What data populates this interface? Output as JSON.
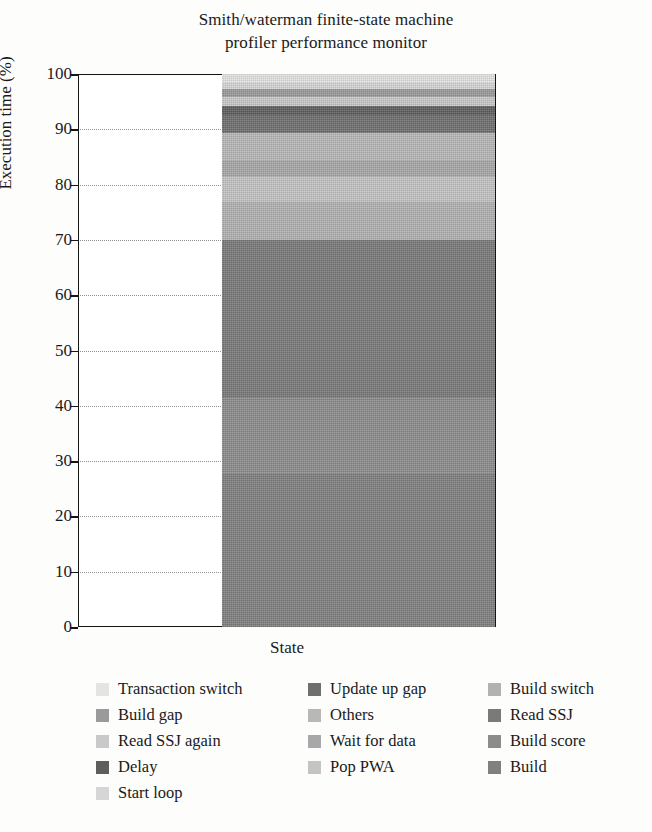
{
  "chart_data": {
    "type": "bar",
    "title": "Smith/waterman finite-state machine profiler performance monitor",
    "title_lines": [
      "Smith/waterman finite-state machine",
      "profiler performance monitor"
    ],
    "xlabel": "State",
    "ylabel": "Execution time (%)",
    "ylim": [
      0,
      100
    ],
    "yticks": [
      100,
      90,
      80,
      70,
      60,
      50,
      40,
      30,
      20,
      10,
      0
    ],
    "grid": "horizontal-dotted",
    "legend_position": "below",
    "legend_columns": 3,
    "categories": [
      "State"
    ],
    "stacked": true,
    "series": [
      {
        "name": "Build",
        "values": [
          28.0
        ],
        "color": "#808080"
      },
      {
        "name": "Build score",
        "values": [
          13.5
        ],
        "color": "#8c8c8c"
      },
      {
        "name": "Read SSJ",
        "values": [
          28.5
        ],
        "color": "#7a7a7a"
      },
      {
        "name": "Build switch",
        "values": [
          7.0
        ],
        "color": "#b2b2b2"
      },
      {
        "name": "Pop PWA",
        "values": [
          4.5
        ],
        "color": "#c4c4c4"
      },
      {
        "name": "Wait for data",
        "values": [
          3.0
        ],
        "color": "#a8a8a8"
      },
      {
        "name": "Others",
        "values": [
          5.0
        ],
        "color": "#b8b8b8"
      },
      {
        "name": "Update up gap",
        "values": [
          3.2
        ],
        "color": "#6f6f6f"
      },
      {
        "name": "Delay",
        "values": [
          1.6
        ],
        "color": "#5e5e5e"
      },
      {
        "name": "Read SSJ again",
        "values": [
          1.6
        ],
        "color": "#c9c9c9"
      },
      {
        "name": "Build gap",
        "values": [
          1.5
        ],
        "color": "#9a9a9a"
      },
      {
        "name": "Start loop",
        "values": [
          1.2
        ],
        "color": "#d6d6d6"
      },
      {
        "name": "Transaction switch",
        "values": [
          1.4
        ],
        "color": "#e4e4e4"
      }
    ],
    "legend_entries": [
      {
        "label": "Transaction switch",
        "color": "#e4e4e4"
      },
      {
        "label": "Build gap",
        "color": "#9a9a9a"
      },
      {
        "label": "Read SSJ again",
        "color": "#c9c9c9"
      },
      {
        "label": "Delay",
        "color": "#5e5e5e"
      },
      {
        "label": "Start loop",
        "color": "#d6d6d6"
      },
      {
        "label": "Update up gap",
        "color": "#6f6f6f"
      },
      {
        "label": "Others",
        "color": "#b8b8b8"
      },
      {
        "label": "Wait for data",
        "color": "#a8a8a8"
      },
      {
        "label": "Pop PWA",
        "color": "#c4c4c4"
      },
      {
        "label": "Build switch",
        "color": "#b2b2b2"
      },
      {
        "label": "Read SSJ",
        "color": "#7a7a7a"
      },
      {
        "label": "Build score",
        "color": "#8c8c8c"
      },
      {
        "label": "Build",
        "color": "#808080"
      }
    ]
  }
}
